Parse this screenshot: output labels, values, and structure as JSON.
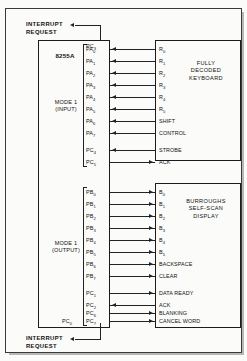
{
  "diagram": {
    "chip": {
      "name": "8255A",
      "mode_input": {
        "line1": "MODE 1",
        "line2": "(INPUT)"
      },
      "mode_output": {
        "line1": "MODE 1",
        "line2": "(OUTPUT)"
      },
      "interrupt_top_pin": "PC3",
      "interrupt_bottom_pin": "PC0"
    },
    "interrupt_top": {
      "line1": "INTERRUPT",
      "line2": "REQUEST"
    },
    "interrupt_bottom": {
      "line1": "INTERRUPT",
      "line2": "REQUEST"
    },
    "keyboard": {
      "title_lines": [
        "FULLY",
        "DECODED",
        "KEYBOARD"
      ],
      "connections": [
        {
          "pin": "PA",
          "pin_sub": "0",
          "signal": "R",
          "signal_sub": "0",
          "direction": "left"
        },
        {
          "pin": "PA",
          "pin_sub": "1",
          "signal": "R",
          "signal_sub": "1",
          "direction": "left"
        },
        {
          "pin": "PA",
          "pin_sub": "2",
          "signal": "R",
          "signal_sub": "2",
          "direction": "left"
        },
        {
          "pin": "PA",
          "pin_sub": "3",
          "signal": "R",
          "signal_sub": "3",
          "direction": "left"
        },
        {
          "pin": "PA",
          "pin_sub": "4",
          "signal": "R",
          "signal_sub": "4",
          "direction": "left"
        },
        {
          "pin": "PA",
          "pin_sub": "5",
          "signal": "R",
          "signal_sub": "5",
          "direction": "left"
        },
        {
          "pin": "PA",
          "pin_sub": "6",
          "signal": "SHIFT",
          "signal_sub": "",
          "direction": "left"
        },
        {
          "pin": "PA",
          "pin_sub": "7",
          "signal": "CONTROL",
          "signal_sub": "",
          "direction": "left"
        },
        {
          "pin": "PC",
          "pin_sub": "4",
          "signal": "STROBE",
          "signal_sub": "",
          "direction": "left"
        },
        {
          "pin": "PC",
          "pin_sub": "5",
          "signal": "ACK",
          "signal_sub": "",
          "direction": "right"
        }
      ]
    },
    "display": {
      "title_lines": [
        "BURROUGHS",
        "SELF-SCAN",
        "DISPLAY"
      ],
      "connections": [
        {
          "pin": "PB",
          "pin_sub": "0",
          "signal": "B",
          "signal_sub": "0",
          "direction": "right"
        },
        {
          "pin": "PB",
          "pin_sub": "1",
          "signal": "B",
          "signal_sub": "1",
          "direction": "right"
        },
        {
          "pin": "PB",
          "pin_sub": "2",
          "signal": "B",
          "signal_sub": "2",
          "direction": "right"
        },
        {
          "pin": "PB",
          "pin_sub": "3",
          "signal": "B",
          "signal_sub": "3",
          "direction": "right"
        },
        {
          "pin": "PB",
          "pin_sub": "4",
          "signal": "B",
          "signal_sub": "4",
          "direction": "right"
        },
        {
          "pin": "PB",
          "pin_sub": "5",
          "signal": "B",
          "signal_sub": "5",
          "direction": "right"
        },
        {
          "pin": "PB",
          "pin_sub": "6",
          "signal": "BACKSPACE",
          "signal_sub": "",
          "direction": "right"
        },
        {
          "pin": "PB",
          "pin_sub": "7",
          "signal": "CLEAR",
          "signal_sub": "",
          "direction": "right"
        },
        {
          "pin": "PC",
          "pin_sub": "1",
          "signal": "DATA READY",
          "signal_sub": "",
          "direction": "right"
        },
        {
          "pin": "PC",
          "pin_sub": "2",
          "signal": "ACK",
          "signal_sub": "",
          "direction": "left"
        },
        {
          "pin": "PC",
          "pin_sub": "6",
          "signal": "BLANKING",
          "signal_sub": "",
          "direction": "right"
        },
        {
          "pin": "PC",
          "pin_sub": "7",
          "signal": "CANCEL WORD",
          "signal_sub": "",
          "direction": "right"
        }
      ]
    },
    "colors": {
      "ink": "#1c1c1c",
      "paper": "#fbfbf9",
      "wire": "#222222"
    }
  }
}
